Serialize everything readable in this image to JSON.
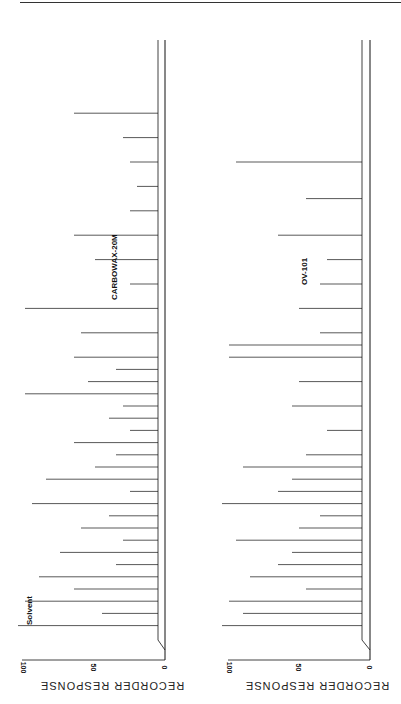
{
  "figure": {
    "orientation": "rotated 90 degrees; retention time increases upward, response increases leftward"
  },
  "chart_data": [
    {
      "type": "line",
      "title": "CARBOWAX-20M",
      "xlabel": "Retention time (min)",
      "ylabel": "RECORDER RESPONSE",
      "x_ticks": [
        "0",
        "20",
        "40",
        "60",
        "80"
      ],
      "y_ticks": [
        "0",
        "50",
        "100"
      ],
      "xlim": [
        0,
        100
      ],
      "ylim": [
        0,
        100
      ],
      "annotations": [
        "Solvent"
      ],
      "grid": false,
      "peaks_x": [
        4,
        6,
        8,
        10,
        12,
        14,
        16,
        18,
        20,
        22,
        24,
        26,
        28,
        30,
        32,
        34,
        36,
        38,
        40,
        42,
        44,
        46,
        48,
        52,
        56,
        60,
        64,
        68,
        72,
        76,
        80,
        84,
        88
      ],
      "peaks_y": [
        100,
        40,
        95,
        60,
        85,
        30,
        70,
        25,
        55,
        35,
        90,
        20,
        80,
        45,
        30,
        60,
        20,
        35,
        25,
        95,
        50,
        30,
        60,
        55,
        95,
        20,
        45,
        60,
        20,
        15,
        20,
        25,
        60
      ]
    },
    {
      "type": "line",
      "title": "OV-101",
      "xlabel": "Retention time (min)",
      "ylabel": "RECORDER RESPONSE",
      "x_ticks": [
        "0",
        "20",
        "40",
        "60",
        "80"
      ],
      "y_ticks": [
        "0",
        "50",
        "100"
      ],
      "xlim": [
        0,
        100
      ],
      "ylim": [
        0,
        100
      ],
      "grid": false,
      "peaks_x": [
        4,
        6,
        8,
        10,
        12,
        14,
        16,
        18,
        20,
        22,
        24,
        26,
        28,
        30,
        32,
        36,
        40,
        44,
        48,
        50,
        52,
        56,
        60,
        64,
        68,
        74,
        80
      ],
      "peaks_y": [
        100,
        85,
        95,
        40,
        80,
        60,
        50,
        90,
        45,
        30,
        100,
        60,
        50,
        85,
        40,
        25,
        50,
        45,
        95,
        95,
        30,
        45,
        30,
        25,
        60,
        40,
        90
      ]
    }
  ],
  "labels": {
    "top_chart_title": "CARBOWAX-20M",
    "bottom_chart_title": "OV-101",
    "y_axis_title_top": "RECORDER RESPONSE",
    "y_axis_title_bottom": "RECORDER RESPONSE",
    "solvent": "Solvent",
    "top_ticks_y": [
      "0",
      "50",
      "100"
    ],
    "bottom_ticks_y": [
      "0",
      "50",
      "100"
    ]
  }
}
